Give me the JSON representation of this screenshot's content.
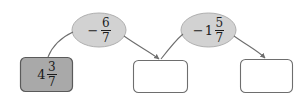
{
  "diagram": {
    "type": "function-machine-flow",
    "background_color": "#ffffff",
    "stroke_color": "#6e6e6e",
    "text_color": "#1c1c1c",
    "box_filled_color": "#a9a9a9",
    "box_empty_color": "#ffffff",
    "oval_fill_color": "#d2d2d2",
    "boxes": [
      {
        "id": "box-1",
        "state": "filled",
        "value": "4 3/7",
        "whole": "4",
        "numerator": "3",
        "denominator": "7",
        "sign": ""
      },
      {
        "id": "box-2",
        "state": "empty",
        "value": "",
        "whole": "",
        "numerator": "",
        "denominator": "",
        "sign": ""
      },
      {
        "id": "box-3",
        "state": "empty",
        "value": "",
        "whole": "",
        "numerator": "",
        "denominator": "",
        "sign": ""
      }
    ],
    "ovals": [
      {
        "id": "oval-1",
        "value": "-6/7",
        "sign": "−",
        "whole": "",
        "numerator": "6",
        "denominator": "7"
      },
      {
        "id": "oval-2",
        "value": "-1 5/7",
        "sign": "−",
        "whole": "1",
        "numerator": "5",
        "denominator": "7"
      }
    ]
  }
}
